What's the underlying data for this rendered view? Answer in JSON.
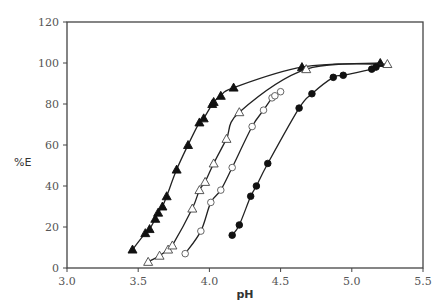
{
  "chart_data": {
    "type": "line",
    "title": "",
    "xlabel": "pH",
    "ylabel": "%E",
    "xlim": [
      3.0,
      5.5
    ],
    "ylim": [
      0,
      120
    ],
    "xticks": [
      3.0,
      3.5,
      4.0,
      4.5,
      5.0,
      5.5
    ],
    "xtick_labels": [
      "3.0",
      "3.5",
      "4.0",
      "4.5",
      "5.0",
      "5.5"
    ],
    "yticks": [
      0,
      20,
      40,
      60,
      80,
      100,
      120
    ],
    "ytick_labels": [
      "0",
      "20",
      "40",
      "60",
      "80",
      "100",
      "120"
    ],
    "grid": false,
    "legend": "none",
    "series": [
      {
        "name": "filled-triangle",
        "marker": "triangle-filled",
        "points": [
          [
            3.46,
            9
          ],
          [
            3.55,
            17
          ],
          [
            3.58,
            19
          ],
          [
            3.62,
            24
          ],
          [
            3.64,
            27
          ],
          [
            3.67,
            30
          ],
          [
            3.7,
            35
          ],
          [
            3.77,
            48
          ],
          [
            3.85,
            60
          ],
          [
            3.93,
            71
          ],
          [
            3.96,
            73
          ],
          [
            4.02,
            80
          ],
          [
            4.03,
            81
          ],
          [
            4.08,
            84
          ],
          [
            4.17,
            88
          ],
          [
            4.65,
            98
          ],
          [
            5.2,
            100
          ]
        ]
      },
      {
        "name": "open-triangle",
        "marker": "triangle-open",
        "points": [
          [
            3.57,
            3
          ],
          [
            3.65,
            6
          ],
          [
            3.71,
            9
          ],
          [
            3.74,
            11
          ],
          [
            3.88,
            29
          ],
          [
            3.93,
            38
          ],
          [
            3.97,
            42
          ],
          [
            4.03,
            51
          ],
          [
            4.12,
            63
          ],
          [
            4.21,
            76
          ],
          [
            4.68,
            97
          ],
          [
            5.25,
            99.5
          ]
        ]
      },
      {
        "name": "open-circle",
        "marker": "circle-open",
        "points": [
          [
            3.83,
            7
          ],
          [
            3.94,
            18
          ],
          [
            4.01,
            32
          ],
          [
            4.08,
            38
          ],
          [
            4.16,
            49
          ],
          [
            4.3,
            69
          ],
          [
            4.38,
            77
          ],
          [
            4.44,
            83
          ],
          [
            4.46,
            84
          ],
          [
            4.5,
            86
          ]
        ]
      },
      {
        "name": "filled-circle",
        "marker": "circle-filled",
        "points": [
          [
            4.16,
            16
          ],
          [
            4.21,
            21
          ],
          [
            4.29,
            35
          ],
          [
            4.33,
            40
          ],
          [
            4.41,
            51
          ],
          [
            4.63,
            78
          ],
          [
            4.72,
            85
          ],
          [
            4.87,
            93
          ],
          [
            4.94,
            94
          ],
          [
            5.14,
            97
          ],
          [
            5.17,
            98
          ]
        ]
      }
    ]
  }
}
